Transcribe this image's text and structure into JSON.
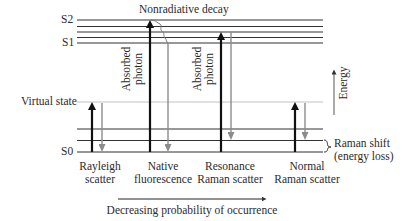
{
  "diagram": {
    "type": "energy-level diagram",
    "levels": {
      "s2": "S2",
      "s1": "S1",
      "virtual": "Virtual state",
      "s0": "S0"
    },
    "top_label": "Nonradiative decay",
    "absorbed_photon": "Absorbed\nphoton",
    "absorbed_line1": "Absorbed",
    "absorbed_line2": "photon",
    "energy_axis": "Energy",
    "raman_shift": {
      "line1": "Raman shift",
      "line2": "(energy loss)"
    },
    "processes": [
      {
        "line1": "Rayleigh",
        "line2": "scatter"
      },
      {
        "line1": "Native",
        "line2": "fluorescence"
      },
      {
        "line1": "Resonance",
        "line2": "Raman scatter"
      },
      {
        "line1": "Normal",
        "line2": "Raman scatter"
      }
    ],
    "bottom_axis": "Decreasing probability of occurrence",
    "colors": {
      "absorption_arrow": "#111111",
      "emission_arrow": "#8c8c8c",
      "level_line": "#333333",
      "virtual_line": "#bbbbbb"
    }
  }
}
